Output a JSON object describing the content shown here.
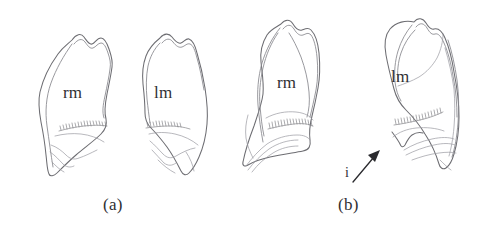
{
  "figure": {
    "background_color": "#ffffff",
    "ink_color": "#6d6d72",
    "text_color": "#2f2f33",
    "width": 482,
    "height": 241,
    "panels": [
      {
        "id": "a",
        "caption": "(a)",
        "caption_x": 103,
        "caption_y": 204,
        "specimens": [
          {
            "id": "a-rm",
            "label": "rm",
            "label_x": 63,
            "label_y": 92,
            "meaning": "right mandible"
          },
          {
            "id": "a-lm",
            "label": "lm",
            "label_x": 154,
            "label_y": 92,
            "meaning": "left mandible"
          }
        ]
      },
      {
        "id": "b",
        "caption": "(b)",
        "caption_x": 338,
        "caption_y": 204,
        "specimens": [
          {
            "id": "b-rm",
            "label": "rm",
            "label_x": 277,
            "label_y": 82,
            "meaning": "right mandible"
          },
          {
            "id": "b-lm",
            "label": "lm",
            "label_x": 391,
            "label_y": 76,
            "meaning": "left mandible"
          }
        ],
        "annotations": [
          {
            "id": "incisor-callout",
            "label": "i",
            "label_x": 345,
            "label_y": 172,
            "arrow_from_x": 353,
            "arrow_from_y": 182,
            "arrow_to_x": 379,
            "arrow_to_y": 151,
            "meaning": "incisure"
          }
        ]
      }
    ]
  }
}
